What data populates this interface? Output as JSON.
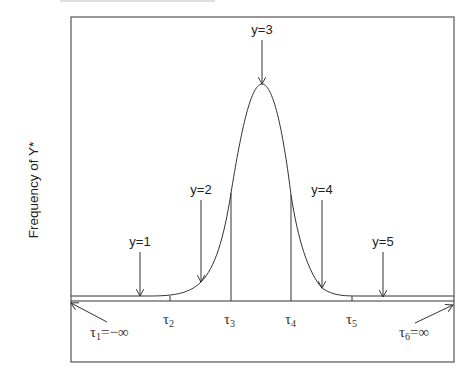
{
  "figure": {
    "type": "diagram",
    "y_axis_label": "Frequency of Y*",
    "categories": [
      {
        "label": "y=1"
      },
      {
        "label": "y=2"
      },
      {
        "label": "y=3"
      },
      {
        "label": "y=4"
      },
      {
        "label": "y=5"
      }
    ],
    "thresholds": [
      {
        "symbol": "τ",
        "sub": "1",
        "suffix": "=−∞"
      },
      {
        "symbol": "τ",
        "sub": "2",
        "suffix": ""
      },
      {
        "symbol": "τ",
        "sub": "3",
        "suffix": ""
      },
      {
        "symbol": "τ",
        "sub": "4",
        "suffix": ""
      },
      {
        "symbol": "τ",
        "sub": "5",
        "suffix": ""
      },
      {
        "symbol": "τ",
        "sub": "6",
        "suffix": "=∞"
      }
    ],
    "colors": {
      "line": "#333333",
      "frame": "#555555",
      "background": "#ffffff"
    }
  }
}
